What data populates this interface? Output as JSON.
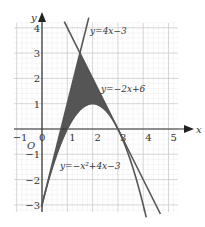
{
  "figure": {
    "type": "function-graph",
    "axes": {
      "x_label": "x",
      "y_label": "y",
      "origin_label": "O",
      "x_ticks": [
        "-1",
        "0",
        "1",
        "2",
        "3",
        "4",
        "5"
      ],
      "x_tick_values": [
        -1,
        0,
        1,
        2,
        3,
        4,
        5
      ],
      "y_ticks": [
        "4",
        "3",
        "2",
        "1",
        "-1",
        "-2",
        "-3"
      ],
      "y_tick_values": [
        4,
        3,
        2,
        1,
        -1,
        -2,
        -3
      ],
      "x_range": [
        -1.1,
        5.4
      ],
      "y_range": [
        -3.3,
        4.2
      ]
    },
    "grid": {
      "major_step": 1,
      "minor_step": 0.2,
      "major_color": "#cfcfcf",
      "minor_color": "#ececec"
    },
    "curves": [
      {
        "name": "line-1",
        "label": "y=4x−3",
        "expr": "4x-3",
        "color": "#555555"
      },
      {
        "name": "line-2",
        "label": "y=−2x+6",
        "expr": "-2x+6",
        "color": "#555555"
      },
      {
        "name": "parabola",
        "label": "y=−x²+4x−3",
        "expr": "-x^2+4x-3",
        "color": "#555555"
      }
    ],
    "shaded_region": {
      "description": "region bounded by y=4x-3, y=-2x+6 and parabola",
      "vertices": [
        [
          0,
          -3
        ],
        [
          1.5,
          3
        ],
        [
          3,
          0
        ]
      ],
      "color": "#555555"
    },
    "labels": {
      "line1": "y=4x−3",
      "line2": "y=−2x+6",
      "parabola": "y=−x²+4x−3"
    }
  }
}
